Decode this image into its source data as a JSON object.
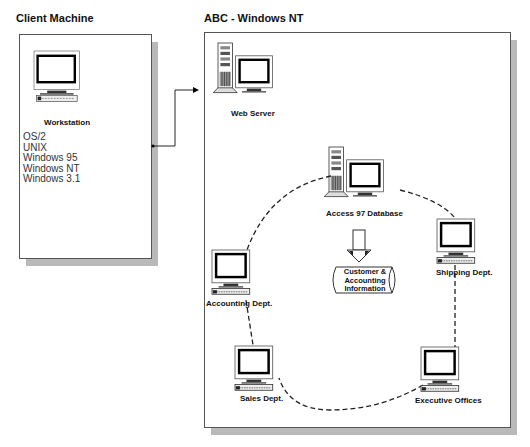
{
  "client": {
    "title": "Client Machine",
    "workstation_label": "Workstation",
    "os_list": [
      "OS/2",
      "UNIX",
      "Windows 95",
      "Windows NT",
      "Windows 3.1"
    ]
  },
  "network": {
    "title": "ABC - Windows NT",
    "web_server_label": "Web Server",
    "database_label": "Access 97 Database",
    "info_store": {
      "line1": "Customer &",
      "line2": "Accounting",
      "line3": "Information"
    },
    "nodes": {
      "shipping": "Shipping Dept.",
      "accounting": "Accounting Dept.",
      "sales": "Sales Dept.",
      "executive": "Executive Offices"
    }
  }
}
